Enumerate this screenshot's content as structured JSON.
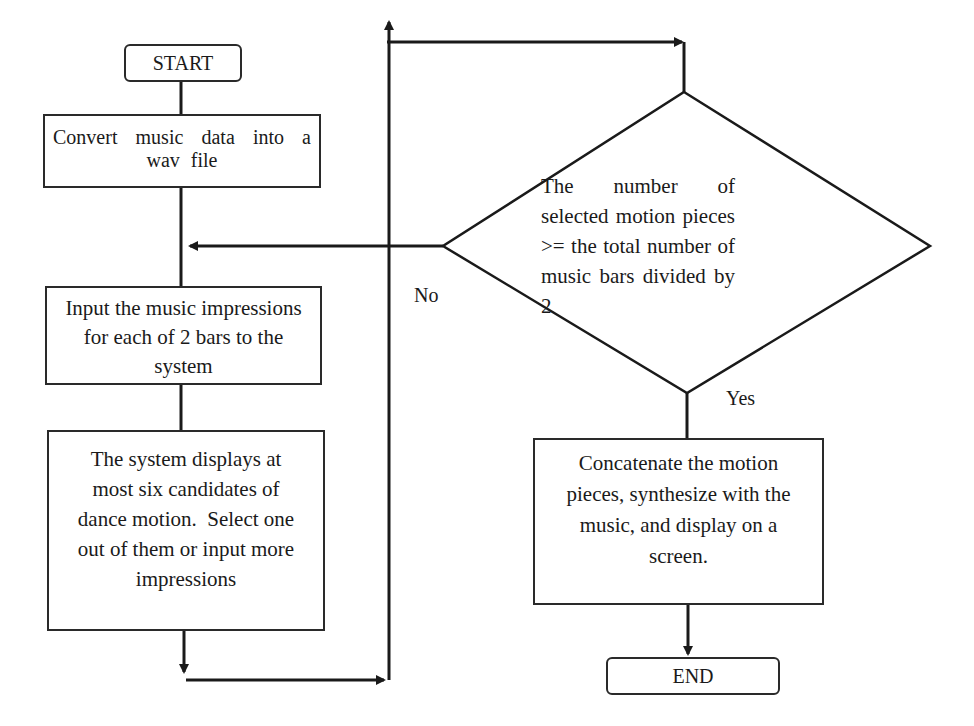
{
  "flowchart": {
    "start": "START",
    "step_convert": "Convert music data into a wav file",
    "step_input": "Input the music impressions for each of 2 bars to the system",
    "step_display": "The system displays at most six candidates of dance motion.  Select one out of them or input more impressions",
    "decision": "The number of selected motion pieces >= the total number of music bars divided by 2",
    "label_no": "No",
    "label_yes": "Yes",
    "step_concat": "Concatenate the motion pieces, synthesize with the music, and display on a screen.",
    "end": "END"
  }
}
